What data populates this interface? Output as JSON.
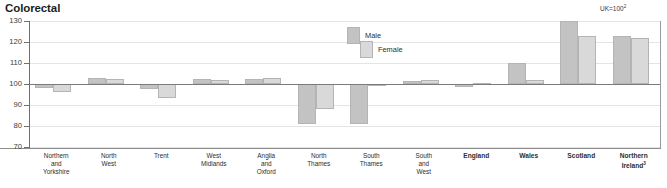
{
  "chart_title": "Colorectal",
  "uk_note": {
    "text": "UK=100",
    "footnote": "2"
  },
  "legend": {
    "male": {
      "label": "Male",
      "color": "#c3c3c3"
    },
    "female": {
      "label": "Female",
      "color": "#d9d9d9"
    }
  },
  "axis": {
    "y_ticks": [
      130,
      120,
      110,
      100,
      90,
      80,
      70
    ]
  },
  "chart_data": {
    "type": "bar",
    "title": "Colorectal",
    "subtitle": "UK=100",
    "xlabel": "",
    "ylabel": "",
    "ylim": [
      70,
      130
    ],
    "ytick_step": 10,
    "grid": true,
    "baseline": 100,
    "legend_position": "inside-top-center",
    "categories": [
      "Northern and Yorkshire",
      "North West",
      "Trent",
      "West Midlands",
      "Anglia and Oxford",
      "North Thames",
      "South Thames",
      "South and West",
      "England",
      "Wales",
      "Scotland",
      "Northern Ireland"
    ],
    "category_labels": [
      [
        "Northern",
        "and",
        "Yorkshire"
      ],
      [
        "North",
        "West"
      ],
      [
        "Trent"
      ],
      [
        "West",
        "Midlands"
      ],
      [
        "Anglia",
        "and",
        "Oxford"
      ],
      [
        "North",
        "Thames"
      ],
      [
        "South",
        "Thames"
      ],
      [
        "South",
        "and",
        "West"
      ],
      [
        "England"
      ],
      [
        "Wales"
      ],
      [
        "Scotland"
      ],
      [
        "Northern",
        "Ireland"
      ]
    ],
    "category_bold": [
      false,
      false,
      false,
      false,
      false,
      false,
      false,
      false,
      true,
      true,
      true,
      true
    ],
    "category_footnote": [
      null,
      null,
      null,
      null,
      null,
      null,
      null,
      null,
      null,
      null,
      null,
      "3"
    ],
    "series": [
      {
        "name": "Male",
        "color": "#c3c3c3",
        "values": [
          98,
          103,
          97.5,
          102.5,
          102.5,
          81,
          81,
          101.5,
          98.5,
          110,
          130,
          123
        ]
      },
      {
        "name": "Female",
        "color": "#d9d9d9",
        "values": [
          96,
          102.5,
          93.5,
          102,
          103,
          88,
          99,
          102,
          100.5,
          102,
          123,
          122
        ]
      }
    ]
  }
}
